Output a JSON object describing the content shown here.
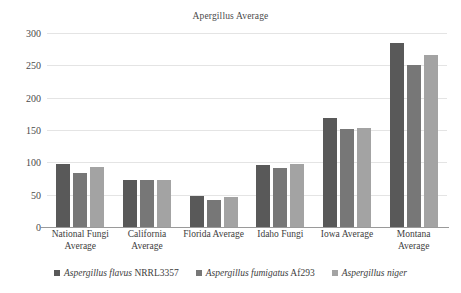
{
  "chart_data": {
    "type": "bar",
    "title": "Apergillus Average",
    "xlabel": "",
    "ylabel": "",
    "ylim": [
      0,
      300
    ],
    "yticks": [
      0,
      50,
      100,
      150,
      200,
      250,
      300
    ],
    "ytick_labels": [
      "0",
      "50",
      "100",
      "150",
      "200",
      "250",
      "300"
    ],
    "grid": true,
    "legend_position": "bottom",
    "categories": [
      "National Fungi Average",
      "California Average",
      "Florida Average",
      "Idaho Fungi",
      "Iowa Average",
      "Montana Average"
    ],
    "category_lines": [
      [
        "National Fungi",
        "Average"
      ],
      [
        "California",
        "Average"
      ],
      [
        "Florida Average"
      ],
      [
        "Idaho Fungi"
      ],
      [
        "Iowa Average"
      ],
      [
        "Montana",
        "Average"
      ]
    ],
    "series": [
      {
        "name": "Aspergillus flavus NRRL3357",
        "name_italic": "Aspergillus flavus",
        "name_plain": "NRRL3357",
        "color": "#595959",
        "values": [
          97,
          72,
          48,
          96,
          168,
          285
        ]
      },
      {
        "name": "Aspergillus fumigatus Af293",
        "name_italic": "Aspergillus fumigatus",
        "name_plain": "Af293",
        "color": "#777777",
        "values": [
          84,
          72,
          42,
          92,
          151,
          251
        ]
      },
      {
        "name": "Aspergillus niger",
        "name_italic": "Aspergillus niger",
        "name_plain": "",
        "color": "#a3a3a3",
        "values": [
          93,
          72,
          46,
          97,
          153,
          266
        ]
      }
    ]
  },
  "colors": {
    "gridline": "#e4e4e4",
    "axis": "#9a9a9a",
    "text": "#3d3d3d",
    "background": "#ffffff"
  }
}
